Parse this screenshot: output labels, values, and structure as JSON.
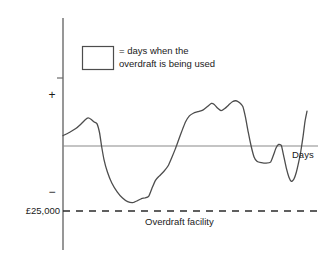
{
  "chart_data": {
    "type": "line",
    "title": "",
    "subtitle": "",
    "xlabel": "Days",
    "ylabel": "",
    "grid": false,
    "legend_position": "top-left",
    "axis_tick_labels": {
      "positive": "+",
      "negative": "−",
      "overdraft_limit": "£25,000"
    },
    "annotations": [
      {
        "name": "overdraft-facility-line",
        "text": "Overdraft facility",
        "value": -25000,
        "style": "dashed"
      },
      {
        "name": "zero-line",
        "text": "",
        "value": 0,
        "style": "solid"
      }
    ],
    "legend": [
      {
        "swatch": "open-rectangle",
        "text_line_1": "= days when the",
        "text_line_2": "overdraft is being used"
      }
    ],
    "axis_ranges": {
      "x": [
        0,
        100
      ],
      "y": [
        -30000,
        20000
      ]
    },
    "series": [
      {
        "name": "account-balance",
        "color": "#4d4d4d",
        "points": [
          {
            "x": 0.0,
            "y": 4000
          },
          {
            "x": 2.6,
            "y": 5200
          },
          {
            "x": 5.1,
            "y": 6600
          },
          {
            "x": 7.3,
            "y": 8400
          },
          {
            "x": 9.0,
            "y": 10000
          },
          {
            "x": 10.3,
            "y": 10800
          },
          {
            "x": 11.6,
            "y": 10200
          },
          {
            "x": 12.8,
            "y": 9200
          },
          {
            "x": 13.9,
            "y": 8600
          },
          {
            "x": 15.0,
            "y": 5000
          },
          {
            "x": 15.8,
            "y": 0
          },
          {
            "x": 16.8,
            "y": -5200
          },
          {
            "x": 18.2,
            "y": -10000
          },
          {
            "x": 20.0,
            "y": -14200
          },
          {
            "x": 22.2,
            "y": -17600
          },
          {
            "x": 24.4,
            "y": -20000
          },
          {
            "x": 26.5,
            "y": -21400
          },
          {
            "x": 28.6,
            "y": -21800
          },
          {
            "x": 30.6,
            "y": -21000
          },
          {
            "x": 32.2,
            "y": -20200
          },
          {
            "x": 33.6,
            "y": -20000
          },
          {
            "x": 35.1,
            "y": -19400
          },
          {
            "x": 36.4,
            "y": -16400
          },
          {
            "x": 37.9,
            "y": -13200
          },
          {
            "x": 39.4,
            "y": -11600
          },
          {
            "x": 41.3,
            "y": -9800
          },
          {
            "x": 43.1,
            "y": -7600
          },
          {
            "x": 44.6,
            "y": -4400
          },
          {
            "x": 46.0,
            "y": -1200
          },
          {
            "x": 47.4,
            "y": 2400
          },
          {
            "x": 48.9,
            "y": 6200
          },
          {
            "x": 50.3,
            "y": 9400
          },
          {
            "x": 51.8,
            "y": 11600
          },
          {
            "x": 53.4,
            "y": 12600
          },
          {
            "x": 55.3,
            "y": 13200
          },
          {
            "x": 57.3,
            "y": 13800
          },
          {
            "x": 59.2,
            "y": 15200
          },
          {
            "x": 60.8,
            "y": 16400
          },
          {
            "x": 62.0,
            "y": 16000
          },
          {
            "x": 63.3,
            "y": 14600
          },
          {
            "x": 64.8,
            "y": 13600
          },
          {
            "x": 66.3,
            "y": 14400
          },
          {
            "x": 67.9,
            "y": 15800
          },
          {
            "x": 69.4,
            "y": 17000
          },
          {
            "x": 70.9,
            "y": 17400
          },
          {
            "x": 72.4,
            "y": 16600
          },
          {
            "x": 73.7,
            "y": 15200
          },
          {
            "x": 74.8,
            "y": 11000
          },
          {
            "x": 75.9,
            "y": 5400
          },
          {
            "x": 77.1,
            "y": 0
          },
          {
            "x": 78.3,
            "y": -4200
          },
          {
            "x": 79.6,
            "y": -6000
          },
          {
            "x": 81.3,
            "y": -6400
          },
          {
            "x": 83.2,
            "y": -6600
          },
          {
            "x": 85.1,
            "y": -6200
          },
          {
            "x": 86.3,
            "y": -3400
          },
          {
            "x": 87.3,
            "y": -800
          },
          {
            "x": 88.4,
            "y": 600
          },
          {
            "x": 89.5,
            "y": 200
          },
          {
            "x": 90.4,
            "y": -3600
          },
          {
            "x": 91.5,
            "y": -8400
          },
          {
            "x": 92.6,
            "y": -12000
          },
          {
            "x": 93.6,
            "y": -13600
          },
          {
            "x": 94.6,
            "y": -12800
          },
          {
            "x": 95.6,
            "y": -10200
          },
          {
            "x": 96.5,
            "y": -6600
          },
          {
            "x": 97.4,
            "y": -2400
          },
          {
            "x": 98.4,
            "y": 3800
          },
          {
            "x": 99.2,
            "y": 9600
          },
          {
            "x": 100.0,
            "y": 13400
          }
        ]
      }
    ]
  },
  "axis": {
    "y_axis_name": "vertical-axis",
    "x_axis_name": "zero-balance-line"
  }
}
